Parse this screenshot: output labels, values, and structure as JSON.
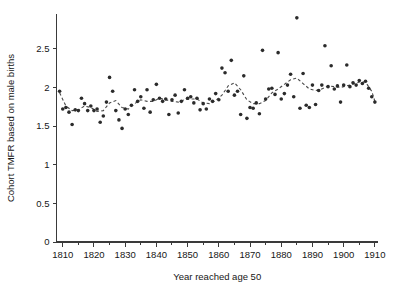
{
  "chart_data": {
    "type": "scatter",
    "title": "",
    "xlabel": "Year reached age 50",
    "ylabel": "Cohort TMFR based on male births",
    "xlim": [
      1808,
      1911
    ],
    "ylim": [
      0,
      2.95
    ],
    "grid": false,
    "legend": null,
    "xticks": [
      1810,
      1820,
      1830,
      1840,
      1850,
      1860,
      1870,
      1880,
      1890,
      1900,
      1910
    ],
    "xtick_labels": [
      "1810",
      "1820",
      "1830",
      "1840",
      "1850",
      "1860",
      "1870",
      "1880",
      "1890",
      "1900",
      "1910"
    ],
    "xminor_ticks": [
      1815,
      1825,
      1835,
      1845,
      1855,
      1865,
      1875,
      1885,
      1895,
      1905
    ],
    "yticks": [
      0,
      0.5,
      1,
      1.5,
      2,
      2.5
    ],
    "ytick_labels": [
      "0",
      "0.5",
      "1",
      "1.5",
      "2",
      "2.5"
    ],
    "marker": "filled-circle",
    "marker_size": 1.8,
    "series": [
      {
        "name": "Cohort TMFR observations",
        "type": "scatter",
        "x": [
          1809,
          1810,
          1811,
          1812,
          1813,
          1814,
          1815,
          1816,
          1817,
          1818,
          1819,
          1820,
          1821,
          1822,
          1823,
          1824,
          1825,
          1826,
          1827,
          1828,
          1829,
          1830,
          1831,
          1832,
          1833,
          1834,
          1835,
          1836,
          1837,
          1838,
          1839,
          1840,
          1841,
          1842,
          1843,
          1844,
          1845,
          1846,
          1847,
          1848,
          1849,
          1850,
          1851,
          1852,
          1853,
          1854,
          1855,
          1856,
          1857,
          1858,
          1859,
          1860,
          1861,
          1862,
          1863,
          1864,
          1865,
          1866,
          1867,
          1868,
          1869,
          1870,
          1871,
          1872,
          1873,
          1874,
          1875,
          1876,
          1877,
          1878,
          1879,
          1880,
          1881,
          1882,
          1883,
          1884,
          1885,
          1886,
          1887,
          1888,
          1889,
          1890,
          1891,
          1892,
          1893,
          1894,
          1895,
          1896,
          1897,
          1898,
          1899,
          1900,
          1901,
          1902,
          1903,
          1904,
          1905,
          1906,
          1907,
          1908,
          1909,
          1910
        ],
        "y": [
          1.95,
          1.72,
          1.74,
          1.68,
          1.52,
          1.71,
          1.7,
          1.86,
          1.79,
          1.7,
          1.76,
          1.7,
          1.72,
          1.55,
          1.63,
          1.81,
          2.13,
          1.95,
          1.7,
          1.58,
          1.47,
          1.72,
          1.65,
          1.77,
          1.97,
          1.82,
          1.88,
          1.73,
          1.97,
          1.68,
          1.84,
          2.04,
          1.86,
          1.82,
          1.85,
          1.65,
          1.84,
          1.9,
          1.67,
          1.82,
          1.97,
          1.86,
          1.88,
          1.8,
          1.86,
          1.71,
          1.79,
          1.72,
          1.85,
          1.82,
          1.92,
          1.84,
          2.25,
          2.19,
          1.95,
          2.35,
          1.9,
          1.95,
          1.65,
          2.15,
          1.6,
          1.74,
          1.73,
          1.8,
          1.66,
          2.48,
          1.85,
          1.98,
          1.99,
          1.91,
          2.45,
          1.85,
          1.92,
          2.03,
          2.17,
          1.88,
          2.9,
          1.73,
          2.18,
          1.77,
          1.74,
          2.03,
          1.78,
          1.96,
          2.03,
          2.54,
          2.01,
          2.28,
          1.98,
          2.02,
          1.81,
          2.03,
          2.29,
          2.01,
          2.06,
          2.03,
          2.09,
          2.05,
          2.08,
          1.99,
          1.88,
          1.81
        ]
      },
      {
        "name": "Smoothed trend",
        "type": "line",
        "style": "dashed",
        "x": [
          1809,
          1811,
          1813,
          1815,
          1817,
          1819,
          1821,
          1823,
          1825,
          1827,
          1829,
          1831,
          1833,
          1835,
          1837,
          1839,
          1841,
          1843,
          1845,
          1847,
          1849,
          1851,
          1853,
          1855,
          1857,
          1859,
          1861,
          1863,
          1865,
          1867,
          1869,
          1871,
          1873,
          1875,
          1877,
          1879,
          1881,
          1883,
          1885,
          1887,
          1889,
          1891,
          1893,
          1895,
          1897,
          1899,
          1901,
          1903,
          1905,
          1907,
          1909,
          1910
        ],
        "y": [
          1.93,
          1.76,
          1.7,
          1.71,
          1.76,
          1.74,
          1.69,
          1.7,
          1.8,
          1.83,
          1.74,
          1.72,
          1.79,
          1.84,
          1.82,
          1.82,
          1.86,
          1.84,
          1.82,
          1.81,
          1.84,
          1.85,
          1.85,
          1.8,
          1.79,
          1.83,
          1.9,
          2.02,
          2.06,
          1.97,
          1.84,
          1.79,
          1.79,
          1.83,
          1.93,
          1.98,
          2.04,
          2.1,
          2.12,
          2.05,
          1.98,
          1.96,
          1.98,
          2.02,
          2.01,
          2.0,
          2.02,
          2.04,
          2.07,
          2.07,
          1.95,
          1.82
        ]
      }
    ]
  }
}
